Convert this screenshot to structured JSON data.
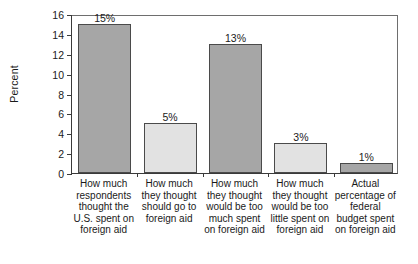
{
  "chart_data": {
    "type": "bar",
    "title": "",
    "xlabel": "",
    "ylabel": "Percent",
    "ylim": [
      0,
      16
    ],
    "yticks": [
      0,
      2,
      4,
      6,
      8,
      10,
      12,
      14,
      16
    ],
    "grid": false,
    "legend": "none",
    "categories": [
      "How much respondents thought the U.S. spent on foreign aid",
      "How much they thought should go to foreign aid",
      "How much they thought would be too much spent on foreign aid",
      "How much they thought would be too little spent on foreign aid",
      "Actual percentage of federal budget spent on foreign aid"
    ],
    "category_lines": [
      [
        "How much",
        "respondents",
        "thought the",
        "U.S. spent on",
        "foreign aid"
      ],
      [
        "How much",
        "they thought",
        "should go to",
        "foreign aid"
      ],
      [
        "How much",
        "they thought",
        "would be too",
        "much spent",
        "on foreign aid"
      ],
      [
        "How much",
        "they thought",
        "would be too",
        "little spent on",
        "foreign aid"
      ],
      [
        "Actual",
        "percentage of",
        "federal",
        "budget spent",
        "on foreign aid"
      ]
    ],
    "values": [
      15,
      5,
      13,
      3,
      1
    ],
    "value_labels": [
      "15%",
      "5%",
      "13%",
      "3%",
      "1%"
    ],
    "bar_shades": [
      "dark",
      "light",
      "dark",
      "light",
      "dark"
    ],
    "colors": {
      "dark_bar": "#a6a6a6",
      "light_bar": "#e2e2e2",
      "bar_border": "#4a4a4a",
      "axis": "#3a3a3a",
      "text": "#1a1a1a",
      "background": "#ffffff"
    }
  }
}
